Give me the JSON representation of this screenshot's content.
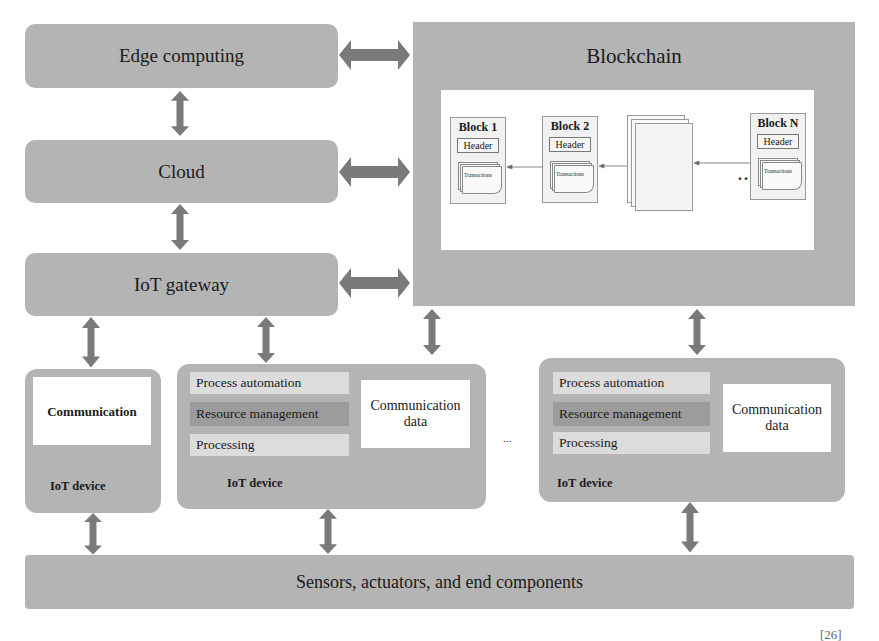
{
  "layers": {
    "edge_computing": "Edge computing",
    "cloud": "Cloud",
    "iot_gateway": "IoT gateway",
    "sensors": "Sensors, actuators, and end components"
  },
  "blockchain": {
    "title": "Blockchain",
    "blocks": [
      {
        "title": "Block 1",
        "header": "Header",
        "transactions": "Transactions"
      },
      {
        "title": "Block 2",
        "header": "Header",
        "transactions": "Transactions"
      },
      {
        "title": "Block N",
        "header": "Header",
        "transactions": "Transactions"
      }
    ],
    "ellipsis": "...."
  },
  "devices": [
    {
      "label": "IoT device",
      "communication": "Communication"
    },
    {
      "label": "IoT device",
      "strips": [
        "Process automation",
        "Resource management",
        "Processing"
      ],
      "comm_data": "Communication data"
    },
    {
      "label": "IoT device",
      "strips": [
        "Process automation",
        "Resource management",
        "Processing"
      ],
      "comm_data": "Communication data"
    }
  ],
  "device_ellipsis": "...",
  "footer_fragment": "[26]",
  "colors": {
    "box_grey": "#b4b4b4",
    "arrow_grey": "#7a7a7a",
    "strip_light": "#dcdcdc",
    "strip_dark": "#9c9c9c"
  }
}
